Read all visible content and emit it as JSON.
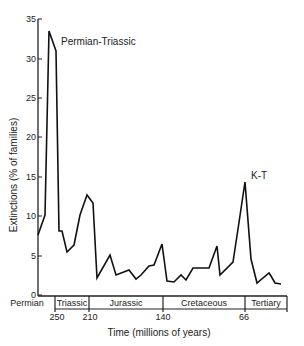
{
  "chart_data": {
    "type": "line",
    "title": "",
    "xlabel": "Time  (millions of years)",
    "ylabel": "Extinctions  (% of families)",
    "ylim": [
      0,
      35
    ],
    "yticks": [
      0,
      5,
      10,
      15,
      20,
      25,
      30,
      35
    ],
    "xtick_labels": [
      "250",
      "210",
      "140",
      "66"
    ],
    "periods": [
      "Permian",
      "Triassic",
      "Jurassic",
      "Cretaceous",
      "Tertiary"
    ],
    "annotations": [
      "Permian-Triassic",
      "K-T"
    ],
    "grid": false,
    "series": [
      {
        "name": "Extinctions",
        "points_px": [
          [
            38,
            235
          ],
          [
            45,
            215
          ],
          [
            49,
            31
          ],
          [
            56,
            51
          ],
          [
            59,
            231
          ],
          [
            62,
            231
          ],
          [
            67,
            252
          ],
          [
            74,
            245
          ],
          [
            80,
            215
          ],
          [
            87,
            195
          ],
          [
            93,
            203
          ],
          [
            97,
            278
          ],
          [
            110,
            255
          ],
          [
            116,
            275
          ],
          [
            129,
            270
          ],
          [
            136,
            279
          ],
          [
            141,
            275
          ],
          [
            149,
            266
          ],
          [
            154,
            265
          ],
          [
            162,
            244
          ],
          [
            167,
            281
          ],
          [
            174,
            282
          ],
          [
            181,
            275
          ],
          [
            186,
            280
          ],
          [
            193,
            268
          ],
          [
            209,
            268
          ],
          [
            217,
            246
          ],
          [
            220,
            275
          ],
          [
            233,
            262
          ],
          [
            238,
            229
          ],
          [
            245,
            182
          ],
          [
            251,
            259
          ],
          [
            257,
            283
          ],
          [
            269,
            273
          ],
          [
            271,
            276
          ],
          [
            275,
            283
          ],
          [
            281,
            284
          ]
        ],
        "values": [
          7.6,
          10.1,
          33.5,
          31.0,
          8.1,
          8.1,
          5.5,
          6.3,
          10.1,
          12.7,
          11.7,
          2.2,
          5.1,
          2.5,
          3.2,
          2.0,
          2.5,
          3.7,
          3.8,
          6.5,
          1.8,
          1.6,
          2.5,
          1.9,
          3.4,
          3.4,
          6.2,
          2.5,
          4.2,
          8.4,
          14.3,
          4.6,
          1.5,
          2.8,
          2.4,
          1.5,
          1.4
        ]
      }
    ]
  },
  "labels": {
    "annotation_pt": "Permian-Triassic",
    "annotation_kt": "K-T",
    "xlabel": "Time  (millions of years)",
    "ylabel": "Extinctions  (% of families)",
    "yticks": [
      "0",
      "5",
      "10",
      "15",
      "20",
      "25",
      "30",
      "35"
    ],
    "xticks": [
      "250",
      "210",
      "140",
      "66"
    ],
    "periods": [
      "Permian",
      "Triassic",
      "Jurassic",
      "Cretaceous",
      "Tertiary"
    ]
  }
}
